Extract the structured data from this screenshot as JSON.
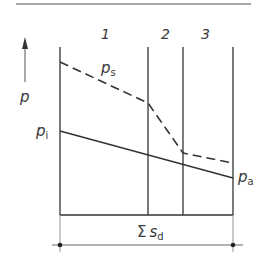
{
  "diagram": {
    "axis_label": "p",
    "zone_labels": [
      "1",
      "2",
      "3"
    ],
    "curves": {
      "upper": {
        "label": "p",
        "subscript": "s",
        "style": "dashed"
      },
      "lower_start": {
        "label": "p",
        "subscript": "i"
      },
      "lower_end": {
        "label": "p",
        "subscript": "a"
      }
    },
    "dimension": {
      "symbol": "Σ",
      "label": "s",
      "subscript": "d"
    },
    "colors": {
      "line": "#333333",
      "text": "#3a3a3a"
    }
  }
}
